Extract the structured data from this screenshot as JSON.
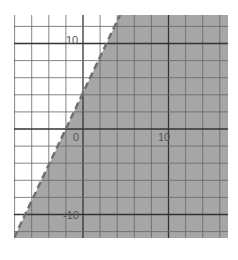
{
  "chart_data": {
    "type": "area",
    "title": "",
    "boundary": {
      "slope": 2,
      "intercept": 5,
      "style": "dashed"
    },
    "shaded_side": "below",
    "xlim": [
      -8,
      16.6
    ],
    "ylim": [
      -12.8,
      13
    ],
    "grid": true,
    "grid_step": 2,
    "tick_labels": {
      "x": [
        "0",
        "10"
      ],
      "y": [
        "10",
        "-10"
      ]
    },
    "xlabel": "",
    "ylabel": ""
  },
  "labels": {
    "origin": "0",
    "x10": "10",
    "y10": "10",
    "yneg10": "-10"
  },
  "colors": {
    "shade": "#a6a6a6",
    "grid": "#555555",
    "line": "#6e6e6e"
  }
}
